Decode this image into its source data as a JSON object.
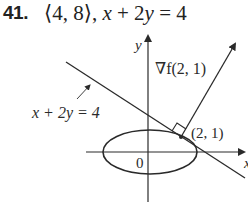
{
  "problem": {
    "number": "41.",
    "vector": "⟨4, 8⟩,",
    "equation_x": "x",
    "equation_rest": " + 2",
    "equation_y": "y",
    "equation_end": " = 4"
  },
  "diagram": {
    "y_axis_label": "y",
    "x_axis_label": "x",
    "origin_label": "0",
    "line_label": "x + 2y = 4",
    "gradient_label": "∇f(2, 1)",
    "point_label": "(2, 1)",
    "colors": {
      "stroke": "#2a2a2a",
      "background": "#ffffff"
    }
  }
}
